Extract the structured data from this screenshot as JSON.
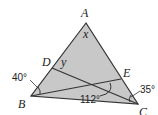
{
  "figure": {
    "fill_color": "#c8c8c8",
    "stroke_color": "#333333",
    "vertices": {
      "A": {
        "label": "A",
        "x": 86,
        "y": 23
      },
      "B": {
        "label": "B",
        "x": 31,
        "y": 96
      },
      "C": {
        "label": "C",
        "x": 138,
        "y": 104
      },
      "D": {
        "label": "D",
        "x": 52,
        "y": 68
      },
      "E": {
        "label": "E",
        "x": 121,
        "y": 79
      }
    },
    "segments": [
      "AB",
      "AC",
      "BC",
      "BE",
      "DC"
    ],
    "angle_labels": {
      "x": "x",
      "y": "y",
      "angle_B": "40°",
      "angle_C": "35°",
      "angle_112": "112°"
    }
  }
}
